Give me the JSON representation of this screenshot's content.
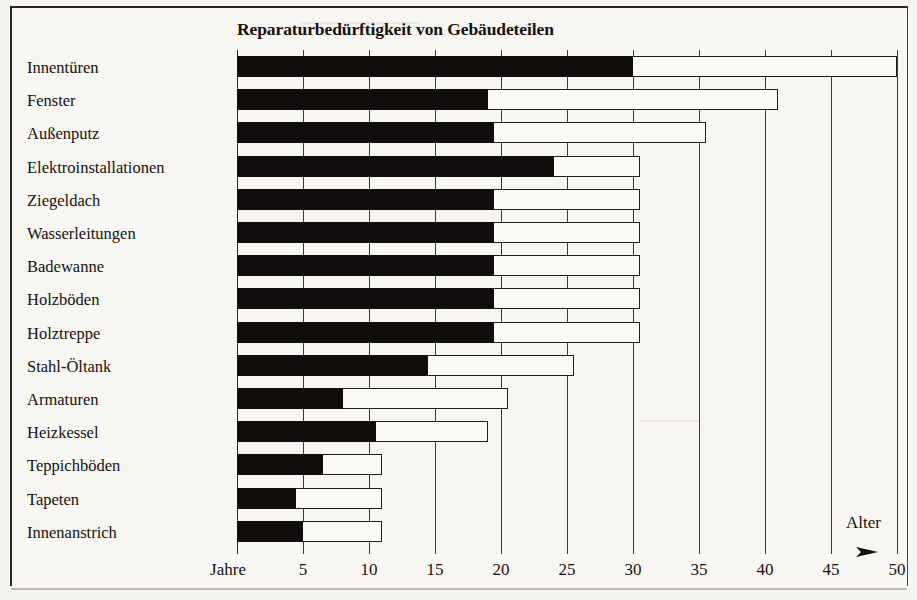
{
  "chart_data": {
    "type": "bar",
    "orientation": "horizontal",
    "stacked": true,
    "title": "Reparaturbedürftigkeit von Gebäudeteilen",
    "xlabel": "Alter",
    "x_axis_unit_label": "Jahre",
    "ylabel": "",
    "xlim": [
      0,
      50
    ],
    "xticks": [
      5,
      10,
      15,
      20,
      25,
      30,
      35,
      40,
      45,
      50
    ],
    "xticklabels": [
      "5",
      "10",
      "15",
      "20",
      "25",
      "30",
      "35",
      "40",
      "45",
      "50"
    ],
    "grid": true,
    "legend": null,
    "series": [
      {
        "name": "Mindestalter (schwarz)",
        "color": "#100d0c"
      },
      {
        "name": "Spanne bis Höchstalter (weiß)",
        "color": "#fbfaf7"
      }
    ],
    "categories": [
      "Innentüren",
      "Fenster",
      "Außenputz",
      "Elektroinstallationen",
      "Ziegeldach",
      "Wasserleitungen",
      "Badewanne",
      "Holzböden",
      "Holztreppe",
      "Stahl-Öltank",
      "Armaturen",
      "Heizkessel",
      "Teppichböden",
      "Tapeten",
      "Innenanstrich"
    ],
    "rows": [
      {
        "label": "Innentüren",
        "solid": 30,
        "total": 50
      },
      {
        "label": "Fenster",
        "solid": 19,
        "total": 41
      },
      {
        "label": "Außenputz",
        "solid": 19.5,
        "total": 35.5
      },
      {
        "label": "Elektroinstallationen",
        "solid": 24,
        "total": 30.5
      },
      {
        "label": "Ziegeldach",
        "solid": 19.5,
        "total": 30.5
      },
      {
        "label": "Wasserleitungen",
        "solid": 19.5,
        "total": 30.5
      },
      {
        "label": "Badewanne",
        "solid": 19.5,
        "total": 30.5
      },
      {
        "label": "Holzböden",
        "solid": 19.5,
        "total": 30.5
      },
      {
        "label": "Holztreppe",
        "solid": 19.5,
        "total": 30.5
      },
      {
        "label": "Stahl-Öltank",
        "solid": 14.5,
        "total": 25.5
      },
      {
        "label": "Armaturen",
        "solid": 8,
        "total": 20.5
      },
      {
        "label": "Heizkessel",
        "solid": 10.5,
        "total": 19
      },
      {
        "label": "Teppichböden",
        "solid": 6.5,
        "total": 11
      },
      {
        "label": "Tapeten",
        "solid": 4.5,
        "total": 11
      },
      {
        "label": "Innenanstrich",
        "solid": 5,
        "total": 11
      }
    ]
  }
}
